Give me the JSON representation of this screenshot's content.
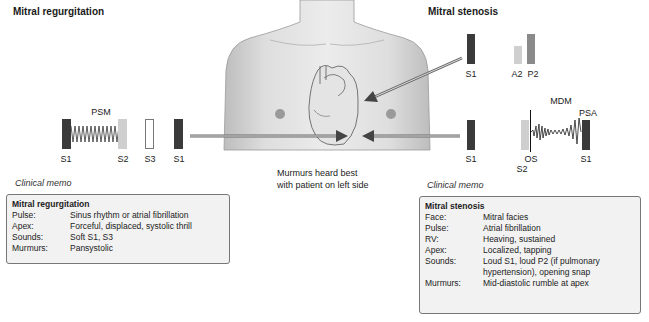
{
  "left": {
    "title": "Mitral regurgitation",
    "murmur_label": "PSM",
    "sounds": [
      "S1",
      "S2",
      "S3",
      "S1"
    ],
    "memo_label": "Clinical memo",
    "memo": {
      "title": "Mitral regurgitation",
      "rows": [
        {
          "k": "Pulse:",
          "v": "Sinus rhythm or atrial fibrillation"
        },
        {
          "k": "Apex:",
          "v": "Forceful, displaced, systolic thrill"
        },
        {
          "k": "Sounds:",
          "v": "Soft S1, S3"
        },
        {
          "k": "Murmurs:",
          "v": "Pansystolic"
        }
      ]
    }
  },
  "right": {
    "title": "Mitral stenosis",
    "top_sounds": [
      "S1",
      "A2",
      "P2"
    ],
    "murmur_label": "MDM",
    "presystolic_label": "PSA",
    "bottom_sounds": {
      "s1_left": "S1",
      "os": "OS",
      "s2": "S2",
      "s1_right": "S1"
    },
    "memo_label": "Clinical memo",
    "memo": {
      "title": "Mitral stenosis",
      "rows": [
        {
          "k": "Face:",
          "v": "Mitral facies"
        },
        {
          "k": "Pulse:",
          "v": "Atrial fibrillation"
        },
        {
          "k": "RV:",
          "v": "Heaving, sustained"
        },
        {
          "k": "Apex:",
          "v": "Localized, tapping"
        },
        {
          "k": "Sounds:",
          "v": "Loud S1, loud P2 (if pulmonary hypertension), opening snap"
        },
        {
          "k": "Murmurs:",
          "v": "Mid-diastolic rumble at apex"
        }
      ]
    }
  },
  "center": {
    "caption_line1": "Murmurs heard best",
    "caption_line2": "with patient on left side"
  },
  "colors": {
    "dark_bar": "#3a3a3a",
    "light_bar": "#cfcfcf",
    "memo_bg": "#f2f2f2",
    "arrow": "#555555"
  }
}
